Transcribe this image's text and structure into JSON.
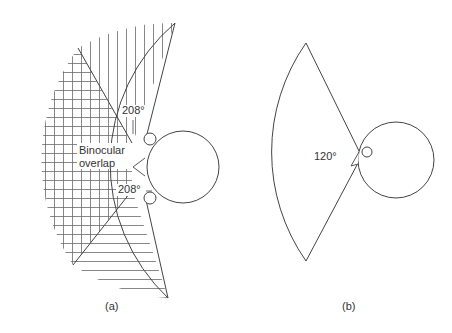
{
  "figure": {
    "panel_a": {
      "caption": "(a)",
      "label_top_angle": "208°",
      "label_bottom_angle": "208°",
      "label_overlap_line1": "Binocular",
      "label_overlap_line2": "overlap",
      "regions": [
        "left-eye field (vertical hatching)",
        "binocular overlap (cross hatching)",
        "right-eye field (horizontal hatching)"
      ]
    },
    "panel_b": {
      "caption": "(b)",
      "label_angle": "120°"
    },
    "colors": {
      "stroke": "#444444",
      "hatch": "#6a6a6a",
      "text": "#333333",
      "background": "#ffffff"
    }
  }
}
